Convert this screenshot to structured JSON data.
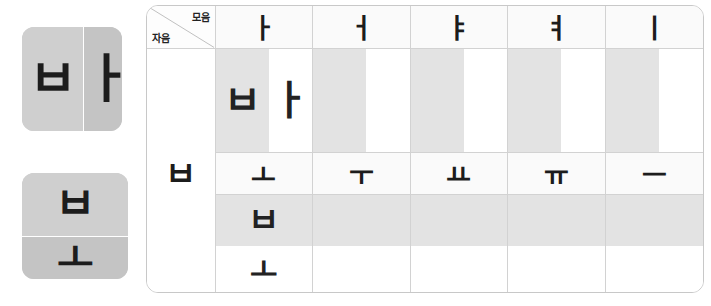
{
  "tiles": [
    {
      "name": "syllable-tile-ba",
      "orientation": "horizontal",
      "syllable": "바",
      "consonant": "ㅂ",
      "vowel": "ㅏ"
    },
    {
      "name": "syllable-tile-bo",
      "orientation": "vertical",
      "syllable": "보",
      "consonant": "ㅂ",
      "vowel": "ㅗ"
    }
  ],
  "table": {
    "corner": {
      "vowel_label": "모음",
      "consonant_label": "자음"
    },
    "consonant": "ㅂ",
    "rows": [
      {
        "id": "vertical-vowels",
        "split": "vertical",
        "vowels": [
          "ㅏ",
          "ㅓ",
          "ㅑ",
          "ㅕ",
          "ㅣ"
        ],
        "cells": [
          {
            "filled": true,
            "consonant": "ㅂ",
            "vowel": "ㅏ",
            "syllable": "바"
          },
          {
            "filled": false,
            "consonant": "",
            "vowel": "",
            "syllable": ""
          },
          {
            "filled": false,
            "consonant": "",
            "vowel": "",
            "syllable": ""
          },
          {
            "filled": false,
            "consonant": "",
            "vowel": "",
            "syllable": ""
          },
          {
            "filled": false,
            "consonant": "",
            "vowel": "",
            "syllable": ""
          }
        ]
      },
      {
        "id": "horizontal-vowels",
        "split": "horizontal",
        "vowels": [
          "ㅗ",
          "ㅜ",
          "ㅛ",
          "ㅠ",
          "ㅡ"
        ],
        "cells": [
          {
            "filled": true,
            "consonant": "ㅂ",
            "vowel": "ㅗ",
            "syllable": "보"
          },
          {
            "filled": false,
            "consonant": "",
            "vowel": "",
            "syllable": ""
          },
          {
            "filled": false,
            "consonant": "",
            "vowel": "",
            "syllable": ""
          },
          {
            "filled": false,
            "consonant": "",
            "vowel": "",
            "syllable": ""
          },
          {
            "filled": false,
            "consonant": "",
            "vowel": "",
            "syllable": ""
          }
        ]
      }
    ]
  },
  "colors": {
    "shade": "#e3e3e3",
    "tile_light": "#cfcfcf",
    "tile_dark": "#c4c4c4",
    "glyph": "#1c1c1c",
    "border": "#d2d2d2"
  }
}
